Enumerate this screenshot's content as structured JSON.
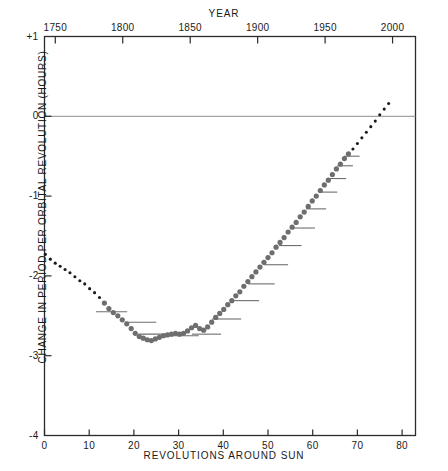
{
  "chart_data": {
    "type": "scatter",
    "title": "",
    "xlabel": "REVOLUTIONS AROUND SUN",
    "ylabel": "CHANGE IN PERIOD PER ORBITAL REVOLUTION (HOURS)",
    "top_axis_label": "YEAR",
    "xlim": [
      0,
      83
    ],
    "ylim": [
      -4,
      1
    ],
    "top_xlim": [
      1742,
      2017
    ],
    "grid": false,
    "legend": false,
    "xticks": [
      0,
      10,
      20,
      30,
      40,
      50,
      60,
      70,
      80
    ],
    "xtick_labels": [
      "0",
      "10",
      "20",
      "30",
      "40",
      "50",
      "60",
      "70",
      "80"
    ],
    "yticks": [
      1,
      0,
      -1,
      -2,
      -3,
      -4
    ],
    "ytick_labels": [
      "+1",
      "0",
      "-1",
      "-2",
      "-3",
      "-4"
    ],
    "top_xticks": [
      1750,
      1800,
      1850,
      1900,
      1950,
      2000
    ],
    "top_xtick_labels": [
      "1750",
      "1800",
      "1850",
      "1900",
      "1950",
      "2000"
    ],
    "zero_line": 0,
    "series": [
      {
        "name": "computed-early",
        "marker": "small-black-dot",
        "color": "#1a1a1a",
        "marker_size": 3.1,
        "points": [
          {
            "x": 0.2,
            "y": -1.73
          },
          {
            "x": 1.3,
            "y": -1.79
          },
          {
            "x": 2.4,
            "y": -1.84
          },
          {
            "x": 3.5,
            "y": -1.88
          },
          {
            "x": 4.6,
            "y": -1.92
          },
          {
            "x": 5.7,
            "y": -1.96
          },
          {
            "x": 6.8,
            "y": -2.01
          },
          {
            "x": 7.9,
            "y": -2.06
          },
          {
            "x": 9.0,
            "y": -2.1
          },
          {
            "x": 10.1,
            "y": -2.16
          },
          {
            "x": 11.2,
            "y": -2.21
          },
          {
            "x": 12.3,
            "y": -2.27
          }
        ]
      },
      {
        "name": "observed-gray",
        "marker": "large-gray-dot",
        "color": "#6e6e6e",
        "marker_size": 5.2,
        "points": [
          {
            "x": 13.4,
            "y": -2.34
          },
          {
            "x": 14.4,
            "y": -2.41
          },
          {
            "x": 15.4,
            "y": -2.46
          },
          {
            "x": 16.4,
            "y": -2.5
          },
          {
            "x": 17.4,
            "y": -2.55
          },
          {
            "x": 18.4,
            "y": -2.6
          },
          {
            "x": 19.4,
            "y": -2.66
          },
          {
            "x": 20.3,
            "y": -2.72
          },
          {
            "x": 21.2,
            "y": -2.76
          },
          {
            "x": 22.1,
            "y": -2.78
          },
          {
            "x": 23.0,
            "y": -2.8
          },
          {
            "x": 23.9,
            "y": -2.81
          },
          {
            "x": 24.8,
            "y": -2.79
          },
          {
            "x": 25.7,
            "y": -2.77
          },
          {
            "x": 26.6,
            "y": -2.75
          },
          {
            "x": 27.5,
            "y": -2.74
          },
          {
            "x": 28.4,
            "y": -2.73
          },
          {
            "x": 29.3,
            "y": -2.72
          },
          {
            "x": 30.2,
            "y": -2.73
          },
          {
            "x": 31.1,
            "y": -2.72
          },
          {
            "x": 32.0,
            "y": -2.69
          },
          {
            "x": 32.9,
            "y": -2.65
          },
          {
            "x": 33.8,
            "y": -2.62
          },
          {
            "x": 34.7,
            "y": -2.66
          },
          {
            "x": 35.6,
            "y": -2.68
          },
          {
            "x": 36.5,
            "y": -2.64
          },
          {
            "x": 37.4,
            "y": -2.58
          },
          {
            "x": 38.3,
            "y": -2.52
          },
          {
            "x": 39.2,
            "y": -2.47
          },
          {
            "x": 40.1,
            "y": -2.42
          },
          {
            "x": 41.0,
            "y": -2.36
          },
          {
            "x": 41.9,
            "y": -2.31
          },
          {
            "x": 42.8,
            "y": -2.25
          },
          {
            "x": 43.7,
            "y": -2.2
          },
          {
            "x": 44.6,
            "y": -2.13
          },
          {
            "x": 45.5,
            "y": -2.07
          },
          {
            "x": 46.4,
            "y": -2.01
          },
          {
            "x": 47.3,
            "y": -1.95
          },
          {
            "x": 48.2,
            "y": -1.89
          },
          {
            "x": 49.1,
            "y": -1.83
          },
          {
            "x": 50.0,
            "y": -1.77
          },
          {
            "x": 50.9,
            "y": -1.71
          },
          {
            "x": 51.8,
            "y": -1.64
          },
          {
            "x": 52.7,
            "y": -1.58
          },
          {
            "x": 53.6,
            "y": -1.52
          },
          {
            "x": 54.5,
            "y": -1.45
          },
          {
            "x": 55.4,
            "y": -1.39
          },
          {
            "x": 56.3,
            "y": -1.33
          },
          {
            "x": 57.2,
            "y": -1.26
          },
          {
            "x": 58.1,
            "y": -1.2
          },
          {
            "x": 59.0,
            "y": -1.13
          },
          {
            "x": 59.9,
            "y": -1.06
          },
          {
            "x": 60.8,
            "y": -1.0
          },
          {
            "x": 61.7,
            "y": -0.93
          },
          {
            "x": 62.6,
            "y": -0.86
          },
          {
            "x": 63.5,
            "y": -0.8
          },
          {
            "x": 64.4,
            "y": -0.73
          },
          {
            "x": 65.3,
            "y": -0.66
          },
          {
            "x": 66.2,
            "y": -0.6
          },
          {
            "x": 67.1,
            "y": -0.53
          },
          {
            "x": 68.0,
            "y": -0.47
          }
        ]
      },
      {
        "name": "predicted-late",
        "marker": "small-black-dot",
        "color": "#1a1a1a",
        "marker_size": 3.1,
        "points": [
          {
            "x": 69.0,
            "y": -0.41
          },
          {
            "x": 70.0,
            "y": -0.34
          },
          {
            "x": 71.0,
            "y": -0.27
          },
          {
            "x": 72.0,
            "y": -0.2
          },
          {
            "x": 73.0,
            "y": -0.13
          },
          {
            "x": 74.0,
            "y": -0.06
          },
          {
            "x": 75.0,
            "y": 0.02
          },
          {
            "x": 76.0,
            "y": 0.09
          },
          {
            "x": 77.0,
            "y": 0.16
          }
        ]
      }
    ],
    "mean_segments": [
      {
        "x_start": 11.5,
        "x_end": 18.5,
        "y": -2.45
      },
      {
        "x_start": 18.0,
        "x_end": 25.0,
        "y": -2.58
      },
      {
        "x_start": 21.0,
        "x_end": 28.5,
        "y": -2.73
      },
      {
        "x_start": 27.0,
        "x_end": 34.5,
        "y": -2.75
      },
      {
        "x_start": 33.0,
        "x_end": 39.5,
        "y": -2.73
      },
      {
        "x_start": 37.5,
        "x_end": 44.0,
        "y": -2.54
      },
      {
        "x_start": 42.0,
        "x_end": 48.0,
        "y": -2.31
      },
      {
        "x_start": 45.5,
        "x_end": 51.5,
        "y": -2.1
      },
      {
        "x_start": 49.0,
        "x_end": 54.5,
        "y": -1.86
      },
      {
        "x_start": 52.5,
        "x_end": 57.5,
        "y": -1.62
      },
      {
        "x_start": 55.5,
        "x_end": 60.5,
        "y": -1.4
      },
      {
        "x_start": 58.5,
        "x_end": 63.0,
        "y": -1.16
      },
      {
        "x_start": 61.5,
        "x_end": 65.5,
        "y": -0.95
      },
      {
        "x_start": 63.5,
        "x_end": 67.5,
        "y": -0.78
      },
      {
        "x_start": 65.5,
        "x_end": 69.0,
        "y": -0.62
      },
      {
        "x_start": 67.0,
        "x_end": 70.5,
        "y": -0.5
      }
    ]
  },
  "colors": {
    "axis": "#2b2b2b",
    "dot_black": "#1a1a1a",
    "dot_gray": "#6e6e6e",
    "segment": "#6e6e6e",
    "zero_line": "#8c8c8c",
    "background": "#ffffff"
  }
}
